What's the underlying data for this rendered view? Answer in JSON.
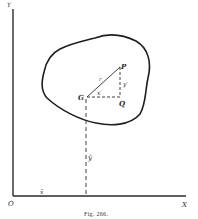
{
  "figure": {
    "caption": "Fig. 266.",
    "colors": {
      "ink": "#2a2a2a",
      "background": "#ffffff"
    }
  },
  "axes": {
    "origin_label": "O",
    "x_axis_label": "X",
    "y_axis_label": "Y"
  },
  "points": {
    "centroid": "G",
    "point": "P",
    "foot": "Q"
  },
  "dimensions": {
    "x_bar": "x̄",
    "y_bar": "ȳ",
    "x_prime": "x′",
    "y_prime": "y′",
    "radius": "r"
  }
}
